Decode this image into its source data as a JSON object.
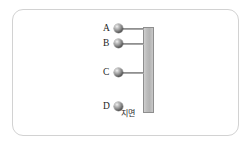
{
  "figure": {
    "type": "physics-diagram",
    "frame": {
      "border_color": "#d2d2d2",
      "background_color": "#ffffff"
    },
    "wall": {
      "name": "vertical-wall",
      "fill_color": "#bdbdbd",
      "border_color": "#8e8e8e",
      "x": 143,
      "y": 27,
      "width": 11,
      "height": 86
    },
    "ground_caption": {
      "text": "지면",
      "x": 121,
      "y": 110
    },
    "points": [
      {
        "id": "A",
        "label": "A",
        "label_x": 103,
        "label_y": 24,
        "ball_x": 114,
        "ball_y": 24,
        "rod": true,
        "rod_x": 122,
        "rod_y": 28,
        "rod_width": 22
      },
      {
        "id": "B",
        "label": "B",
        "label_x": 103,
        "label_y": 39,
        "ball_x": 114,
        "ball_y": 39,
        "rod": true,
        "rod_x": 122,
        "rod_y": 43,
        "rod_width": 22
      },
      {
        "id": "C",
        "label": "C",
        "label_x": 103,
        "label_y": 68,
        "ball_x": 114,
        "ball_y": 68,
        "rod": true,
        "rod_x": 122,
        "rod_y": 72,
        "rod_width": 22
      },
      {
        "id": "D",
        "label": "D",
        "label_x": 103,
        "label_y": 102,
        "ball_x": 114,
        "ball_y": 102,
        "rod": false,
        "rod_x": 0,
        "rod_y": 0,
        "rod_width": 0
      }
    ]
  }
}
